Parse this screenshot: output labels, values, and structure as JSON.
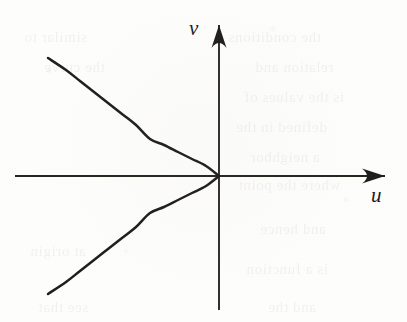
{
  "figure": {
    "kind": "line",
    "background_color": "#fdfdfb",
    "ink_color": "#1f1e1c",
    "axes": {
      "horizontal": {
        "label": "u",
        "name": "u-axis",
        "x_start": 15,
        "x_end": 385,
        "y": 176,
        "arrow_at": "end"
      },
      "vertical": {
        "label": "v",
        "name": "v-axis",
        "y_start": 310,
        "y_end": 25,
        "x": 219,
        "arrow_at": "end"
      },
      "origin": {
        "x": 219,
        "y": 176
      }
    },
    "curve": {
      "name": "leftward-parabola",
      "description": "parabola opening in the negative u direction with vertex at the origin, tangent to the u-axis",
      "equation": "u = -k v^2",
      "vertex": {
        "u": 0,
        "v": 0
      },
      "opens": "left",
      "branches": [
        {
          "name": "upper-branch",
          "points": [
            [
              219,
              176
            ],
            [
              206,
              166
            ],
            [
              192,
              159
            ],
            [
              178,
              152
            ],
            [
              164,
              145
            ],
            [
              150,
              139
            ],
            [
              136,
              125
            ],
            [
              122,
              114
            ],
            [
              108,
              103
            ],
            [
              94,
              92
            ],
            [
              80,
              81
            ],
            [
              66,
              70
            ],
            [
              48,
              58
            ]
          ]
        },
        {
          "name": "lower-branch",
          "points": [
            [
              219,
              176
            ],
            [
              206,
              186
            ],
            [
              192,
              193
            ],
            [
              178,
              200
            ],
            [
              164,
              207
            ],
            [
              150,
              213
            ],
            [
              136,
              227
            ],
            [
              122,
              238
            ],
            [
              108,
              249
            ],
            [
              94,
              260
            ],
            [
              80,
              271
            ],
            [
              66,
              282
            ],
            [
              48,
              294
            ]
          ]
        }
      ]
    },
    "ghost_text": [
      {
        "text": "the conditions",
        "left": 228,
        "top": 22
      },
      {
        "text": "relation and",
        "left": 255,
        "top": 52
      },
      {
        "text": "is the values of",
        "left": 244,
        "top": 82
      },
      {
        "text": "defined in the",
        "left": 236,
        "top": 112
      },
      {
        "text": "a neighbor",
        "left": 250,
        "top": 142
      },
      {
        "text": "where the point",
        "left": 238,
        "top": 170
      },
      {
        "text": "and hence",
        "left": 260,
        "top": 214
      },
      {
        "text": "is a function",
        "left": 246,
        "top": 254
      },
      {
        "text": "and the",
        "left": 268,
        "top": 292
      },
      {
        "text": "similar to",
        "left": 24,
        "top": 22
      },
      {
        "text": "the curve",
        "left": 44,
        "top": 52
      },
      {
        "text": "at origin",
        "left": 30,
        "top": 236
      },
      {
        "text": "see that",
        "left": 38,
        "top": 292
      }
    ]
  }
}
